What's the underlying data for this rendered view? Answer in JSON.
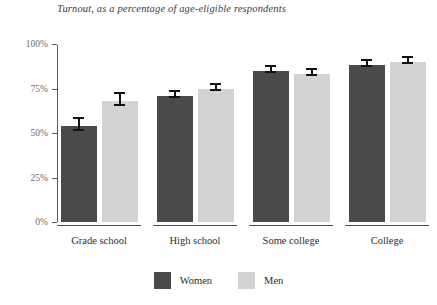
{
  "chart_data": {
    "type": "bar",
    "title": "Turnout, as a percentage of age-eligible respondents",
    "xlabel": "",
    "ylabel": "",
    "ylim": [
      0,
      100
    ],
    "ytick_labels": [
      "0%",
      "25%",
      "50%",
      "75%",
      "100%"
    ],
    "ytick_values": [
      0,
      25,
      50,
      75,
      100
    ],
    "grid": false,
    "legend_position": "bottom",
    "categories": [
      "Grade school",
      "High school",
      "Some college",
      "College"
    ],
    "series": [
      {
        "name": "Women",
        "color": "#4a4a4a",
        "values": [
          54,
          71,
          85,
          88
        ],
        "errors": [
          4,
          2,
          2,
          2
        ]
      },
      {
        "name": "Men",
        "color": "#d2d2d2",
        "values": [
          68,
          75,
          83,
          90
        ],
        "errors": [
          4,
          2,
          2,
          2
        ]
      }
    ]
  },
  "legend": {
    "items": [
      {
        "label": "Women",
        "swatch": "women-swatch"
      },
      {
        "label": "Men",
        "swatch": "men-swatch"
      }
    ]
  }
}
